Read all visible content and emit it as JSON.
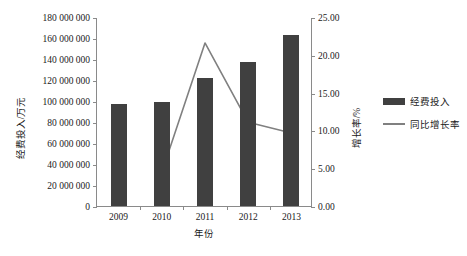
{
  "chart_data": {
    "type": "bar",
    "title": "",
    "xlabel": "年份",
    "categories": [
      "2009",
      "2010",
      "2011",
      "2012",
      "2013"
    ],
    "series": [
      {
        "name": "经费投入",
        "type": "bar",
        "axis": "left",
        "unit": "万元",
        "values": [
          97000000,
          99000000,
          122000000,
          137000000,
          163000000
        ],
        "color": "#404040"
      },
      {
        "name": "同比增长率",
        "type": "line",
        "axis": "right",
        "unit": "%",
        "values": [
          null,
          4.6,
          21.7,
          11.2,
          9.8
        ],
        "color": "#808080"
      }
    ],
    "y_left": {
      "label": "经费投入/万元",
      "min": 0,
      "max": 180000000,
      "step": 20000000,
      "ticks": [
        "0",
        "20 000 000",
        "40 000 000",
        "60 000 000",
        "80 000 000",
        "100 000 000",
        "120 000 000",
        "140 000 000",
        "160 000 000",
        "180 000 000"
      ]
    },
    "y_right": {
      "label": "增长率/%",
      "min": 0,
      "max": 25,
      "step": 5,
      "ticks": [
        "0.00",
        "5.00",
        "10.00",
        "15.00",
        "20.00",
        "25.00"
      ]
    },
    "grid": false,
    "legend_position": "right",
    "legend": [
      "经费投入",
      "同比增长率"
    ]
  }
}
